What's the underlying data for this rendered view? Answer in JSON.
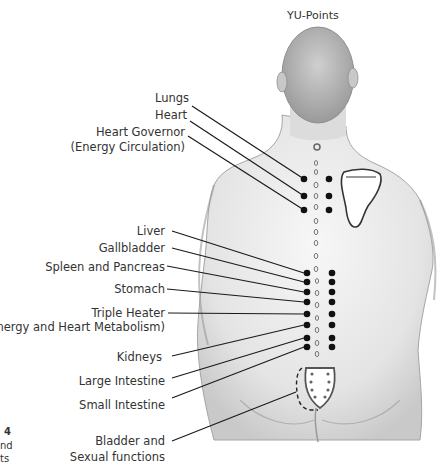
{
  "title": "YU-Points",
  "labels": [
    {
      "id": "lungs",
      "text": "Lungs",
      "right": 189,
      "top": 91
    },
    {
      "id": "heart",
      "text": "Heart",
      "right": 187,
      "top": 108
    },
    {
      "id": "heart-governor",
      "text": "Heart Governor",
      "right": 185,
      "top": 125
    },
    {
      "id": "heart-governor-sub",
      "text": "(Energy Circulation)",
      "right": 185,
      "top": 140
    },
    {
      "id": "liver",
      "text": "Liver",
      "right": 165,
      "top": 224
    },
    {
      "id": "gallbladder",
      "text": "Gallbladder",
      "right": 165,
      "top": 241
    },
    {
      "id": "spleen-pancreas",
      "text": "Spleen and Pancreas",
      "right": 165,
      "top": 260
    },
    {
      "id": "stomach",
      "text": "Stomach",
      "right": 165,
      "top": 282
    },
    {
      "id": "triple-heater",
      "text": "Triple Heater",
      "right": 165,
      "top": 306
    },
    {
      "id": "triple-heater-sub",
      "text": "(Energy and Heart Metabolism)",
      "right": 165,
      "top": 320
    },
    {
      "id": "kidneys",
      "text": "Kidneys",
      "right": 162,
      "top": 350
    },
    {
      "id": "large-intestine",
      "text": "Large Intestine",
      "right": 165,
      "top": 374
    },
    {
      "id": "small-intestine",
      "text": "Small Intestine",
      "right": 165,
      "top": 398
    },
    {
      "id": "bladder",
      "text": "Bladder and",
      "right": 165,
      "top": 434
    },
    {
      "id": "bladder-sub",
      "text": "Sexual functions",
      "right": 165,
      "top": 450
    }
  ],
  "fragments": {
    "number": "4",
    "line1": "nd",
    "line2": "ts"
  },
  "colors": {
    "dot": "#111111",
    "line": "#1a1a1a",
    "sketch": "#8a8a8a"
  }
}
